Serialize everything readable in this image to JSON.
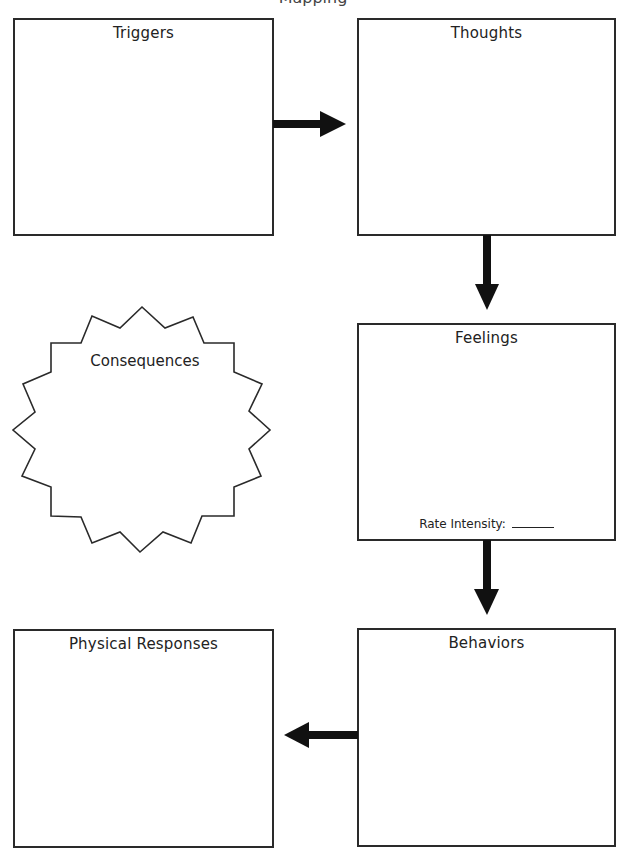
{
  "page": {
    "title_clipped": "Mapping"
  },
  "boxes": {
    "triggers": {
      "label": "Triggers"
    },
    "thoughts": {
      "label": "Thoughts"
    },
    "feelings": {
      "label": "Feelings",
      "rate_label": "Rate Intensity:",
      "rate_value": ""
    },
    "behaviors": {
      "label": "Behaviors"
    },
    "physical_responses": {
      "label": "Physical Responses"
    }
  },
  "consequences": {
    "label": "Consequences"
  },
  "arrows": [
    {
      "from": "Triggers",
      "to": "Thoughts",
      "direction": "right"
    },
    {
      "from": "Thoughts",
      "to": "Feelings",
      "direction": "down"
    },
    {
      "from": "Feelings",
      "to": "Behaviors",
      "direction": "down"
    },
    {
      "from": "Behaviors",
      "to": "Physical Responses",
      "direction": "left"
    }
  ],
  "colors": {
    "stroke": "#2a2a2a",
    "arrow": "#111111",
    "background": "#ffffff"
  }
}
